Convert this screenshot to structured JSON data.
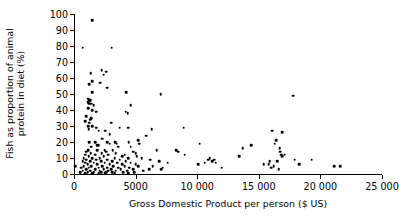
{
  "chart_data": {
    "type": "scatter",
    "title": "",
    "xlabel": "Gross Domestic Product per person ($ US)",
    "ylabel_line1": "Fish as proportion of animal",
    "ylabel_line2": "protein in diet (%)",
    "ylabel": "Fish as proportion of animal protein in diet (%)",
    "xlim": [
      0,
      25000
    ],
    "ylim": [
      0,
      100
    ],
    "xticks": [
      0,
      5000,
      10000,
      15000,
      20000,
      25000
    ],
    "xticklabels": [
      "0",
      "5000",
      "10 000",
      "15 000",
      "20 000",
      "25 000"
    ],
    "yticks": [
      0,
      10,
      20,
      30,
      40,
      50,
      60,
      70,
      80,
      90,
      100
    ],
    "yticklabels": [
      "0",
      "10",
      "20",
      "30",
      "40",
      "50",
      "60",
      "70",
      "80",
      "90",
      "100"
    ],
    "grid": false,
    "legend": false,
    "marker": "filled-circle",
    "marker_color": "#000000",
    "points": [
      [
        120,
        5
      ],
      [
        1500,
        96
      ],
      [
        700,
        79
      ],
      [
        3050,
        79
      ],
      [
        1350,
        63
      ],
      [
        2250,
        65
      ],
      [
        2600,
        64
      ],
      [
        2400,
        62
      ],
      [
        1500,
        58
      ],
      [
        1250,
        56
      ],
      [
        2150,
        57
      ],
      [
        2700,
        54
      ],
      [
        1500,
        51
      ],
      [
        4250,
        51
      ],
      [
        7050,
        50
      ],
      [
        17800,
        49
      ],
      [
        1150,
        47
      ],
      [
        1250,
        46
      ],
      [
        1300,
        46
      ],
      [
        1150,
        45
      ],
      [
        1400,
        44
      ],
      [
        1250,
        44
      ],
      [
        1600,
        43
      ],
      [
        4600,
        43
      ],
      [
        1150,
        41
      ],
      [
        1500,
        40
      ],
      [
        1800,
        39
      ],
      [
        4200,
        39
      ],
      [
        4350,
        38
      ],
      [
        1000,
        36
      ],
      [
        1400,
        35
      ],
      [
        1300,
        34
      ],
      [
        900,
        33
      ],
      [
        1250,
        32
      ],
      [
        3000,
        32
      ],
      [
        8900,
        29
      ],
      [
        1150,
        30
      ],
      [
        1500,
        30
      ],
      [
        1800,
        29
      ],
      [
        3700,
        29
      ],
      [
        4400,
        29
      ],
      [
        1200,
        28
      ],
      [
        6300,
        28
      ],
      [
        2000,
        27
      ],
      [
        2550,
        27
      ],
      [
        16100,
        27
      ],
      [
        16900,
        26
      ],
      [
        2900,
        25
      ],
      [
        5850,
        24
      ],
      [
        2300,
        22
      ],
      [
        5200,
        21
      ],
      [
        16400,
        21
      ],
      [
        1250,
        20
      ],
      [
        1700,
        20
      ],
      [
        2700,
        20
      ],
      [
        3350,
        20
      ],
      [
        4450,
        20
      ],
      [
        10200,
        19
      ],
      [
        2900,
        19
      ],
      [
        3450,
        19
      ],
      [
        5300,
        19
      ],
      [
        16300,
        19
      ],
      [
        1900,
        18
      ],
      [
        2000,
        18
      ],
      [
        14400,
        18
      ],
      [
        1400,
        17
      ],
      [
        3600,
        17
      ],
      [
        4600,
        17
      ],
      [
        13700,
        16
      ],
      [
        16700,
        16
      ],
      [
        1150,
        15
      ],
      [
        1900,
        15
      ],
      [
        2500,
        15
      ],
      [
        3150,
        15
      ],
      [
        6700,
        15
      ],
      [
        8300,
        15
      ],
      [
        1000,
        14
      ],
      [
        2600,
        14
      ],
      [
        4800,
        14
      ],
      [
        8450,
        14
      ],
      [
        16750,
        14
      ],
      [
        1350,
        13
      ],
      [
        2250,
        13
      ],
      [
        3400,
        13
      ],
      [
        5000,
        13
      ],
      [
        16800,
        12
      ],
      [
        17100,
        12
      ],
      [
        900,
        12
      ],
      [
        1700,
        12
      ],
      [
        2800,
        12
      ],
      [
        4100,
        12
      ],
      [
        9000,
        12
      ],
      [
        1200,
        11
      ],
      [
        2400,
        11
      ],
      [
        3900,
        11
      ],
      [
        5100,
        11
      ],
      [
        13400,
        11
      ],
      [
        16900,
        11
      ],
      [
        800,
        10
      ],
      [
        1500,
        10
      ],
      [
        2100,
        10
      ],
      [
        3300,
        10
      ],
      [
        4400,
        10
      ],
      [
        5500,
        10
      ],
      [
        11000,
        10
      ],
      [
        19300,
        9
      ],
      [
        1000,
        9
      ],
      [
        1800,
        9
      ],
      [
        2700,
        9
      ],
      [
        3700,
        9
      ],
      [
        6200,
        9
      ],
      [
        10900,
        9
      ],
      [
        11400,
        9
      ],
      [
        17900,
        9
      ],
      [
        700,
        8
      ],
      [
        1300,
        8
      ],
      [
        2200,
        8
      ],
      [
        3100,
        8
      ],
      [
        4200,
        8
      ],
      [
        6900,
        8
      ],
      [
        11200,
        8
      ],
      [
        15900,
        8
      ],
      [
        16500,
        8
      ],
      [
        900,
        7
      ],
      [
        1600,
        7
      ],
      [
        2500,
        7
      ],
      [
        3500,
        7
      ],
      [
        4600,
        7
      ],
      [
        7600,
        7
      ],
      [
        10600,
        7
      ],
      [
        11500,
        7
      ],
      [
        18300,
        6
      ],
      [
        1100,
        6
      ],
      [
        1900,
        6
      ],
      [
        2900,
        6
      ],
      [
        3900,
        6
      ],
      [
        5000,
        6
      ],
      [
        10100,
        6
      ],
      [
        15400,
        6
      ],
      [
        15800,
        6
      ],
      [
        21100,
        5
      ],
      [
        21600,
        5
      ],
      [
        800,
        5
      ],
      [
        1400,
        5
      ],
      [
        2300,
        5
      ],
      [
        3200,
        5
      ],
      [
        4100,
        5
      ],
      [
        5200,
        5
      ],
      [
        6400,
        5
      ],
      [
        16200,
        5
      ],
      [
        600,
        4
      ],
      [
        1200,
        4
      ],
      [
        2000,
        4
      ],
      [
        2700,
        4
      ],
      [
        3600,
        4
      ],
      [
        4500,
        4
      ],
      [
        7200,
        4
      ],
      [
        12000,
        4
      ],
      [
        16000,
        4
      ],
      [
        1000,
        3
      ],
      [
        1700,
        3
      ],
      [
        2400,
        3
      ],
      [
        3000,
        3
      ],
      [
        3800,
        3
      ],
      [
        4800,
        3
      ],
      [
        6100,
        3
      ],
      [
        7100,
        3
      ],
      [
        16600,
        3
      ],
      [
        700,
        2
      ],
      [
        1300,
        2
      ],
      [
        2100,
        2
      ],
      [
        2800,
        2
      ],
      [
        3400,
        2
      ],
      [
        4300,
        2
      ],
      [
        5600,
        2
      ],
      [
        500,
        1
      ],
      [
        1100,
        1
      ],
      [
        1600,
        1
      ],
      [
        2200,
        1
      ],
      [
        2600,
        1
      ],
      [
        3100,
        1
      ],
      [
        4000,
        1
      ],
      [
        4900,
        1
      ],
      [
        900,
        0.5
      ],
      [
        1500,
        0.5
      ],
      [
        2000,
        0.5
      ],
      [
        2500,
        0.5
      ],
      [
        3300,
        0.5
      ],
      [
        4400,
        0.5
      ]
    ]
  }
}
